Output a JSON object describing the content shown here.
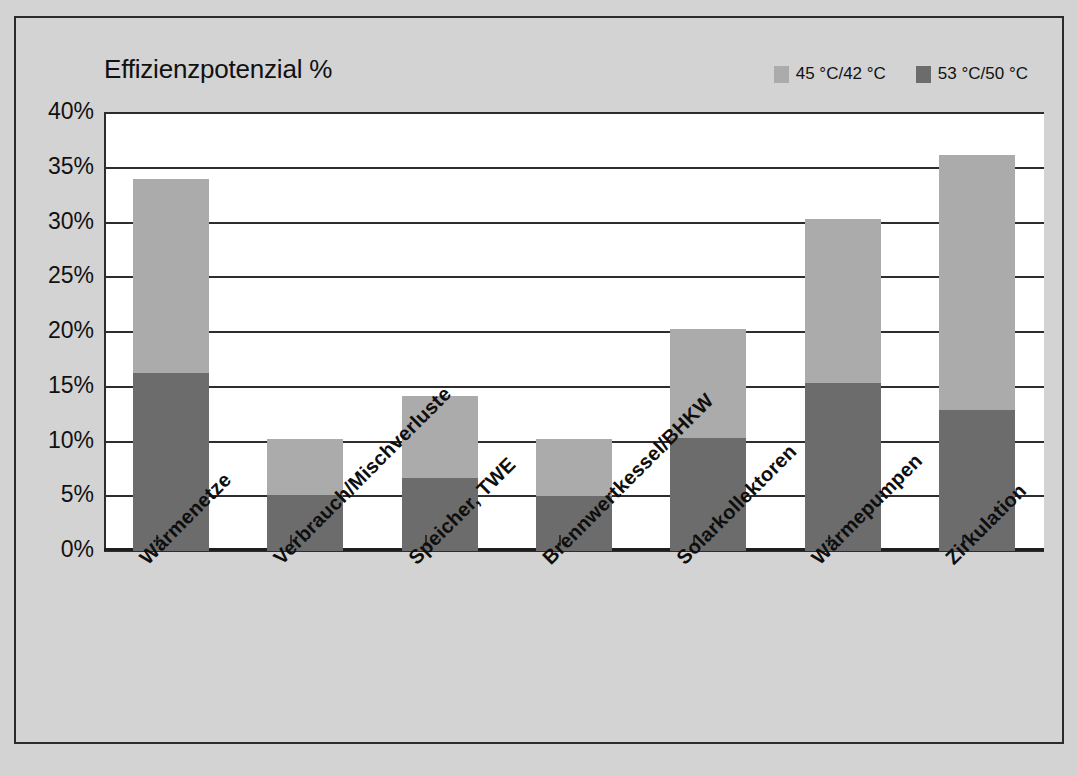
{
  "chart_data": {
    "type": "bar",
    "subtype": "stacked-bar",
    "title": "Effizienzpotenzial %",
    "xlabel": "",
    "ylabel": "",
    "ylim": [
      0,
      40
    ],
    "ytick_labels": [
      "40%",
      "35%",
      "30%",
      "25%",
      "20%",
      "15%",
      "10%",
      "5%",
      "0%"
    ],
    "ytick_values": [
      40,
      35,
      30,
      25,
      20,
      15,
      10,
      5,
      0
    ],
    "grid": true,
    "legend_position": "top-right",
    "categories": [
      "Wärmenetze",
      "Verbrauch/Mischverluste",
      "Speicher, TWE",
      "Brennwertkessel/BHKW",
      "Solarkollektoren",
      "Wärmepumpen",
      "Zirkulation"
    ],
    "series": [
      {
        "name": "53 °C/50 °C",
        "color": "#6c6c6c",
        "values": [
          16.3,
          5.1,
          6.7,
          5.0,
          10.3,
          15.3,
          12.9
        ]
      },
      {
        "name": "45 °C/42 °C",
        "color": "#ababab",
        "values": [
          17.7,
          5.1,
          7.5,
          5.2,
          10.0,
          15.0,
          23.3
        ]
      }
    ],
    "totals": [
      34.0,
      10.2,
      14.2,
      10.2,
      20.3,
      30.3,
      36.2
    ]
  },
  "legend": {
    "entries": [
      {
        "label": "45 °C/42 °C",
        "color": "#ababab"
      },
      {
        "label": "53 °C/50 °C",
        "color": "#6c6c6c"
      }
    ]
  },
  "caption": {
    "text": ""
  }
}
